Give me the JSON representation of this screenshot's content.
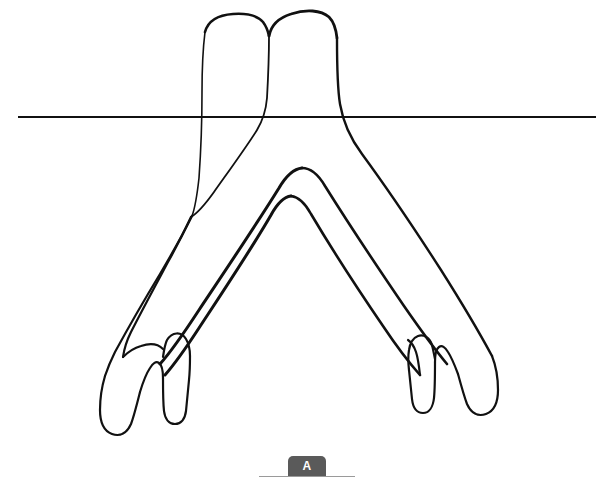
{
  "page": {
    "background_color": "#ffffff",
    "width": 610,
    "height": 485
  },
  "figure": {
    "title": "",
    "stroke_color": "#111111",
    "fill_color": "#ffffff",
    "reference_line": {
      "name": "horizontal-reference-line",
      "color": "#111111",
      "y": 117,
      "x_start": 18,
      "x_end": 596,
      "thickness": 2
    },
    "label": {
      "text": "A",
      "badge_color": "#5a5a5a",
      "text_color": "#ffffff",
      "rule_color": "#9a9a9a"
    }
  }
}
